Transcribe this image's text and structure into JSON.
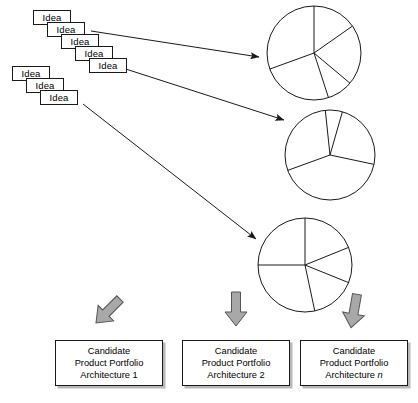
{
  "diagram": {
    "colors": {
      "stroke": "#1a1a1a",
      "arrow_fill": "#a8a8a8",
      "arrow_stroke": "#555555",
      "box_shadow": "#b8b8b8",
      "background": "#ffffff"
    }
  },
  "idea_stacks": [
    {
      "name": "upper-idea-stack",
      "cards": [
        {
          "label": "Idea",
          "x": 33,
          "y": 10
        },
        {
          "label": "Idea",
          "x": 47,
          "y": 22
        },
        {
          "label": "Idea",
          "x": 61,
          "y": 34
        },
        {
          "label": "Idea",
          "x": 75,
          "y": 46
        },
        {
          "label": "Idea",
          "x": 89,
          "y": 58
        }
      ]
    },
    {
      "name": "lower-idea-stack",
      "cards": [
        {
          "label": "Idea",
          "x": 12,
          "y": 66
        },
        {
          "label": "Idea",
          "x": 26,
          "y": 78
        },
        {
          "label": "Idea",
          "x": 40,
          "y": 90
        }
      ]
    }
  ],
  "pies": [
    {
      "name": "candidate-architecture-pie-1",
      "cx": 314,
      "cy": 53,
      "r": 47,
      "slice_angles_deg": [
        90,
        35,
        -40,
        -72,
        200
      ]
    },
    {
      "name": "candidate-architecture-pie-2",
      "cx": 330,
      "cy": 155,
      "r": 45,
      "slice_angles_deg": [
        96,
        74,
        -12,
        -160
      ]
    },
    {
      "name": "candidate-architecture-pie-3",
      "cx": 305,
      "cy": 265,
      "r": 47,
      "slice_angles_deg": [
        90,
        22,
        -22,
        -78,
        180
      ]
    }
  ],
  "flow_arrows": [
    {
      "name": "ideas-to-pie-1",
      "x1": 91,
      "y1": 31,
      "x2": 259,
      "y2": 57
    },
    {
      "name": "ideas-to-pie-2",
      "x1": 104,
      "y1": 62,
      "x2": 284,
      "y2": 120
    },
    {
      "name": "ideas-to-pie-3",
      "x1": 83,
      "y1": 104,
      "x2": 256,
      "y2": 239
    }
  ],
  "block_arrows": [
    {
      "name": "block-arrow-to-architecture-1",
      "cx": 108,
      "cy": 311,
      "rotation_deg": 225
    },
    {
      "name": "block-arrow-to-architecture-2",
      "cx": 236,
      "cy": 309,
      "rotation_deg": 180
    },
    {
      "name": "block-arrow-to-architecture-n",
      "cx": 354,
      "cy": 311,
      "rotation_deg": 190
    }
  ],
  "architecture_boxes": [
    {
      "name": "architecture-box-1",
      "x": 55,
      "y": 340,
      "line1": "Candidate",
      "line2": "Product Portfolio",
      "line3_prefix": "Architecture ",
      "line3_index": "1",
      "index_italic": false
    },
    {
      "name": "architecture-box-2",
      "x": 182,
      "y": 340,
      "line1": "Candidate",
      "line2": "Product Portfolio",
      "line3_prefix": "Architecture ",
      "line3_index": "2",
      "index_italic": false
    },
    {
      "name": "architecture-box-n",
      "x": 300,
      "y": 340,
      "line1": "Candidate",
      "line2": "Product Portfolio",
      "line3_prefix": "Architecture ",
      "line3_index": "n",
      "index_italic": true
    }
  ]
}
